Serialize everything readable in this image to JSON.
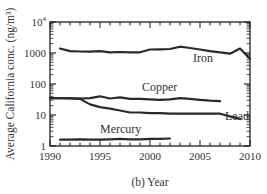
{
  "chart_data": {
    "type": "line",
    "title": "",
    "xlabel": "(b) Year",
    "ylabel": "Average California conc. (ng/m³)",
    "yscale": "log",
    "xlim": [
      1990,
      2010
    ],
    "ylim": [
      1,
      10000
    ],
    "grid": false,
    "legend": "inline labels",
    "x_ticks": [
      1990,
      1995,
      2000,
      2005,
      2010
    ],
    "x_tick_labels": [
      "1990",
      "1995",
      "2000",
      "2005",
      "2010"
    ],
    "y_ticks": [
      1,
      10,
      100,
      1000,
      10000
    ],
    "y_tick_labels": [
      "1",
      "10",
      "100",
      "1000",
      "10⁴"
    ],
    "series": [
      {
        "name": "Iron",
        "label_pos": [
          2004.3,
          500
        ],
        "points": [
          [
            1991,
            1400
          ],
          [
            1992,
            1150
          ],
          [
            1993,
            1120
          ],
          [
            1994,
            1100
          ],
          [
            1995,
            1150
          ],
          [
            1996,
            1050
          ],
          [
            1997,
            1080
          ],
          [
            1998,
            1050
          ],
          [
            1999,
            1050
          ],
          [
            2000,
            1300
          ],
          [
            2001,
            1320
          ],
          [
            2002,
            1350
          ],
          [
            2003,
            1600
          ],
          [
            2004,
            1450
          ],
          [
            2005,
            1300
          ],
          [
            2006,
            1150
          ],
          [
            2007,
            1050
          ],
          [
            2008,
            950
          ],
          [
            2009,
            1400
          ],
          [
            2010,
            650
          ]
        ]
      },
      {
        "name": "Copper",
        "label_pos": [
          1999.2,
          58
        ],
        "points": [
          [
            1990,
            35
          ],
          [
            1991,
            35
          ],
          [
            1992,
            35
          ],
          [
            1993,
            34
          ],
          [
            1994,
            35
          ],
          [
            1995,
            40
          ],
          [
            1996,
            34
          ],
          [
            1997,
            37
          ],
          [
            1998,
            33
          ],
          [
            1999,
            33
          ],
          [
            2000,
            32
          ],
          [
            2001,
            31
          ],
          [
            2002,
            32
          ],
          [
            2003,
            35
          ],
          [
            2004,
            33
          ],
          [
            2005,
            31
          ],
          [
            2006,
            29
          ],
          [
            2007,
            28
          ]
        ]
      },
      {
        "name": "Lead",
        "label_pos": [
          2007.5,
          7
        ],
        "points": [
          [
            1990,
            35
          ],
          [
            1991,
            35
          ],
          [
            1992,
            34
          ],
          [
            1993,
            33
          ],
          [
            1994,
            22
          ],
          [
            1995,
            18
          ],
          [
            1996,
            16
          ],
          [
            1997,
            14
          ],
          [
            1998,
            12
          ],
          [
            1999,
            12
          ],
          [
            2000,
            11.5
          ],
          [
            2001,
            11.5
          ],
          [
            2002,
            11
          ],
          [
            2003,
            11
          ],
          [
            2004,
            11
          ],
          [
            2005,
            11
          ],
          [
            2006,
            11
          ],
          [
            2007,
            11
          ],
          [
            2008,
            9
          ],
          [
            2009,
            7.5
          ]
        ]
      },
      {
        "name": "Mercury",
        "label_pos": [
          1995,
          2.6
        ],
        "points": [
          [
            1991,
            1.6
          ],
          [
            1992,
            1.6
          ],
          [
            1993,
            1.65
          ],
          [
            1994,
            1.6
          ],
          [
            1995,
            1.6
          ],
          [
            1996,
            1.65
          ],
          [
            1997,
            1.7
          ],
          [
            1998,
            1.65
          ],
          [
            1999,
            1.65
          ],
          [
            2000,
            1.7
          ],
          [
            2001,
            1.7
          ],
          [
            2002,
            1.75
          ]
        ]
      }
    ]
  },
  "labels": {
    "xlabel": "(b) Year",
    "ylabel": "Average California conc. (ng/m³)",
    "iron": "Iron",
    "copper": "Copper",
    "lead": "Lead",
    "mercury": "Mercury"
  },
  "style": {
    "line_color": "#2a2a2a",
    "axis_color": "#222222",
    "text_color": "#333333"
  }
}
